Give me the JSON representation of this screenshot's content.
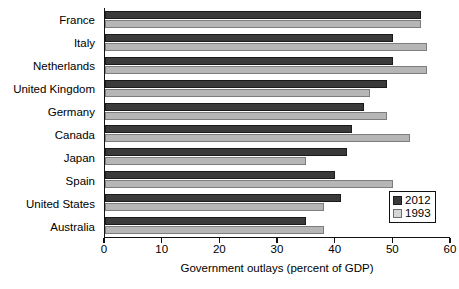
{
  "chart_data": {
    "type": "bar",
    "orientation": "horizontal",
    "title": "",
    "xlabel": "Government outlays (percent of GDP)",
    "ylabel": "",
    "xlim": [
      0,
      60
    ],
    "xticks": [
      0,
      10,
      20,
      30,
      40,
      50,
      60
    ],
    "xtick_labels": [
      "0",
      "10",
      "20",
      "30",
      "40",
      "50",
      "60"
    ],
    "grid": false,
    "legend_position": "lower-right",
    "categories": [
      "France",
      "Italy",
      "Netherlands",
      "United Kingdom",
      "Germany",
      "Canada",
      "Japan",
      "Spain",
      "United States",
      "Australia"
    ],
    "series": [
      {
        "name": "2012",
        "color": "#3a3a3a",
        "values": [
          55,
          50,
          50,
          49,
          45,
          43,
          42,
          40,
          41,
          35
        ]
      },
      {
        "name": "1993",
        "color": "#b6b6b6",
        "values": [
          55,
          56,
          56,
          46,
          49,
          53,
          35,
          50,
          38,
          38
        ]
      }
    ]
  },
  "legend": {
    "items": [
      {
        "label": "2012",
        "swatch": "dark-swatch-icon"
      },
      {
        "label": "1993",
        "swatch": "light-swatch-icon"
      }
    ]
  }
}
